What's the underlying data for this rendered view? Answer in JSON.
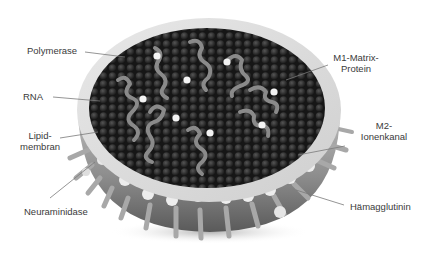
{
  "diagram": {
    "colors": {
      "background": "#ffffff",
      "text": "#3a3a3a",
      "leader_line": "#7a7a7a",
      "membrane_outer": "#c9c9c9",
      "membrane_rim": "#e6e6e6",
      "interior": "#1e1e1e",
      "rna": "#8a8a8a",
      "polymerase": "#f4f4f4",
      "spike": "#9a9a9a"
    },
    "labels": {
      "polymerase": "Polymerase",
      "rna": "RNA",
      "lipid_line1": "Lipid-",
      "lipid_line2": "membran",
      "neuraminidase": "Neuraminidase",
      "m1_line1": "M1-Matrix-",
      "m1_line2": "Protein",
      "m2_line1": "M2-",
      "m2_line2": "Ionenkanal",
      "hemagglutinin": "Hämagglutinin"
    }
  }
}
